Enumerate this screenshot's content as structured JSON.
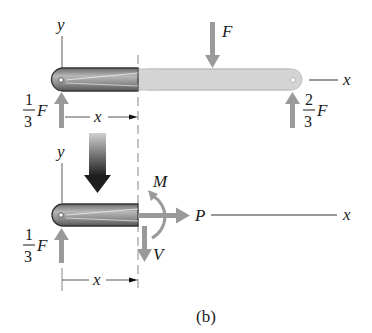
{
  "figure": {
    "caption": "(b)",
    "top_diagram": {
      "axis_y_label": "y",
      "axis_x_label": "x",
      "applied_force_label": "F",
      "left_reaction": {
        "numerator": "1",
        "denominator": "3",
        "symbol": "F"
      },
      "right_reaction": {
        "numerator": "2",
        "denominator": "3",
        "symbol": "F"
      },
      "dimension_label": "x"
    },
    "bottom_diagram": {
      "axis_y_label": "y",
      "axis_x_label": "x",
      "left_reaction": {
        "numerator": "1",
        "denominator": "3",
        "symbol": "F"
      },
      "moment_label": "M",
      "normal_force_label": "P",
      "shear_force_label": "V",
      "dimension_label": "x"
    },
    "colors": {
      "force_arrow": "#9a9a9a",
      "beam_dark": "#555555",
      "beam_light": "#d4d4d4",
      "ink": "#1a1a1a"
    }
  }
}
